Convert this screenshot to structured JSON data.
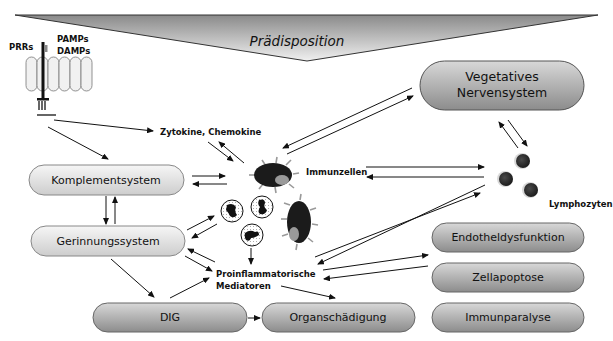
{
  "header": {
    "title": "Prädisposition"
  },
  "receptor": {
    "prrs_label": "PRRs",
    "pamps_label": "PAMPs",
    "damps_label": "DAMPs"
  },
  "nodes": {
    "vegetatives": {
      "line1": "Vegetatives",
      "line2": "Nervensystem"
    },
    "zytokine": "Zytokine, Chemokine",
    "komplement": "Komplementsystem",
    "gerinnung": "Gerinnungssystem",
    "immunzellen": "Immunzellen",
    "lymphozyten": "Lymphozyten",
    "proinflammatorisch": {
      "line1": "Proinflammatorische",
      "line2": "Mediatoren"
    },
    "endothel": "Endotheldysfunktion",
    "zellapoptose": "Zellapoptose",
    "immunparalyse": "Immunparalyse",
    "dig": "DIG",
    "organ": "Organschädigung"
  },
  "colors": {
    "light_pill_top": "#f4f4f4",
    "light_pill_bottom": "#cfcfcf",
    "dark_pill_top": "#d6d6d6",
    "dark_pill_bottom": "#8e8e8e",
    "funnel_top": "#8a8a8a",
    "funnel_bottom": "#f0f0f0",
    "cell_dark": "#1c1c1c",
    "cell_spot": "#9a9a9a",
    "lymph_nucleus": "#3a3a3a"
  }
}
